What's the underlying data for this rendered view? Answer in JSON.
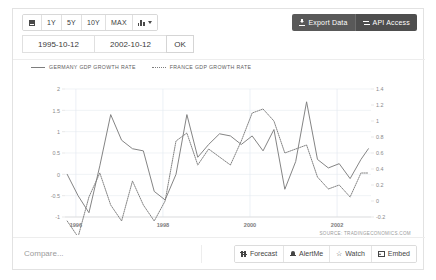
{
  "toolbar": {
    "calendar_icon": "calendar-icon",
    "ranges": [
      {
        "label": "1Y"
      },
      {
        "label": "5Y"
      },
      {
        "label": "10Y"
      },
      {
        "label": "MAX"
      }
    ],
    "chart_type_icon": "bar-chart-icon",
    "export_label": "Export Data",
    "api_label": "API Access",
    "export_icon": "download-icon",
    "api_icon": "api-icon"
  },
  "date_range": {
    "start": "1995-10-12",
    "end": "2002-10-12",
    "ok_label": "OK"
  },
  "legend": [
    {
      "label": "GERMANY GDP GROWTH RATE",
      "style": "solid",
      "color": "#7d7d7d"
    },
    {
      "label": "FRANCE GDP GROWTH RATE",
      "style": "dotted",
      "color": "#7d7d7d"
    }
  ],
  "source": "SOURCE: TRADINGECONOMICS.COM",
  "bottom": {
    "compare_placeholder": "Compare...",
    "buttons": [
      {
        "label": "Forecast",
        "icon": "sliders-icon"
      },
      {
        "label": "AlertMe",
        "icon": "bell-icon"
      },
      {
        "label": "Watch",
        "icon": "star-icon"
      },
      {
        "label": "Embed",
        "icon": "image-icon"
      }
    ]
  },
  "chart_data": {
    "type": "line",
    "title": "",
    "xlabel": "",
    "ylabel": "",
    "grid": true,
    "legend_position": "top-left",
    "x_ticks": [
      "1996",
      "1998",
      "2000",
      "2002"
    ],
    "x_tick_values": [
      1996,
      1998,
      2000,
      2002
    ],
    "xlim": [
      1995.75,
      2002.78
    ],
    "left_axis": {
      "label": "",
      "ylim": [
        -1,
        2
      ],
      "ticks": [
        2,
        1.5,
        1,
        0.5,
        0,
        -0.5,
        -1
      ],
      "series": "GERMANY GDP GROWTH RATE"
    },
    "right_axis": {
      "label": "",
      "ylim": [
        -0.2,
        1.4
      ],
      "ticks": [
        1.4,
        1.2,
        1,
        0.8,
        0.6,
        0.4,
        0.2,
        0,
        -0.2
      ],
      "series": "FRANCE GDP GROWTH RATE"
    },
    "series": [
      {
        "name": "GERMANY GDP GROWTH RATE",
        "axis": "left",
        "style": "solid",
        "color": "#7d7d7d",
        "x": [
          1995.8,
          1996.05,
          1996.3,
          1996.55,
          1996.8,
          1997.05,
          1997.3,
          1997.55,
          1997.8,
          1998.05,
          1998.3,
          1998.55,
          1998.8,
          1999.05,
          1999.3,
          1999.55,
          1999.8,
          2000.05,
          2000.3,
          2000.55,
          2000.8,
          2001.05,
          2001.3,
          2001.55,
          2001.8,
          2002.05,
          2002.3,
          2002.55,
          2002.72
        ],
        "values": [
          0.0,
          -0.5,
          -0.9,
          0.2,
          1.4,
          0.8,
          0.6,
          0.55,
          -0.4,
          -0.6,
          0.0,
          1.4,
          0.4,
          0.7,
          0.95,
          0.9,
          0.7,
          0.9,
          0.55,
          1.05,
          -0.35,
          0.3,
          1.7,
          0.35,
          0.15,
          0.25,
          -0.1,
          0.35,
          0.6
        ]
      },
      {
        "name": "FRANCE GDP GROWTH RATE",
        "axis": "right",
        "style": "dotted",
        "color": "#7d7d7d",
        "x": [
          1995.8,
          1996.05,
          1996.3,
          1996.55,
          1996.8,
          1997.05,
          1997.3,
          1997.55,
          1997.8,
          1998.05,
          1998.3,
          1998.55,
          1998.8,
          1999.05,
          1999.3,
          1999.55,
          1999.8,
          2000.05,
          2000.3,
          2000.55,
          2000.8,
          2001.05,
          2001.3,
          2001.55,
          2001.8,
          2002.05,
          2002.3,
          2002.55,
          2002.72
        ],
        "values": [
          -0.25,
          -0.45,
          0.05,
          0.35,
          -0.05,
          -0.25,
          0.25,
          -0.05,
          -0.25,
          0.0,
          0.75,
          0.85,
          0.45,
          0.65,
          0.55,
          0.45,
          0.75,
          1.1,
          1.15,
          1.0,
          0.6,
          0.65,
          0.7,
          0.3,
          0.15,
          0.2,
          0.05,
          0.35,
          0.35
        ]
      }
    ]
  }
}
